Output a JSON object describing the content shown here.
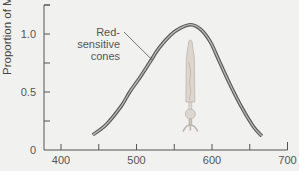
{
  "chart_data": {
    "type": "line",
    "title": "",
    "xlabel": "",
    "ylabel": "Proportion of M",
    "xlim": [
      380,
      700
    ],
    "ylim": [
      0,
      1.2
    ],
    "x_ticks": [
      400,
      450,
      500,
      550,
      600,
      650,
      700
    ],
    "x_tick_labels": [
      "400",
      "",
      "500",
      "",
      "600",
      "",
      "700"
    ],
    "y_ticks": [
      0,
      0.25,
      0.5,
      0.75,
      1.0,
      1.25
    ],
    "y_tick_labels": [
      "0",
      "",
      "0.5",
      "",
      "1.0",
      ""
    ],
    "grid": false,
    "series": [
      {
        "name": "Red-sensitive cones",
        "color": "#5a5a5a",
        "x": [
          442,
          460,
          480,
          491,
          505,
          518,
          530,
          545,
          558,
          572,
          585,
          598,
          610,
          625,
          640,
          655,
          666
        ],
        "y": [
          0.13,
          0.22,
          0.38,
          0.5,
          0.63,
          0.76,
          0.88,
          0.99,
          1.05,
          1.08,
          1.04,
          0.93,
          0.76,
          0.55,
          0.36,
          0.2,
          0.12
        ]
      }
    ],
    "annotations": [
      {
        "lines": [
          "Red-",
          "sensitive",
          "cones"
        ],
        "points_to": {
          "x": 518,
          "y": 0.76
        }
      }
    ],
    "illustration": {
      "name": "cone-cell",
      "color": "#dcd6cf",
      "x_center": 570
    }
  }
}
